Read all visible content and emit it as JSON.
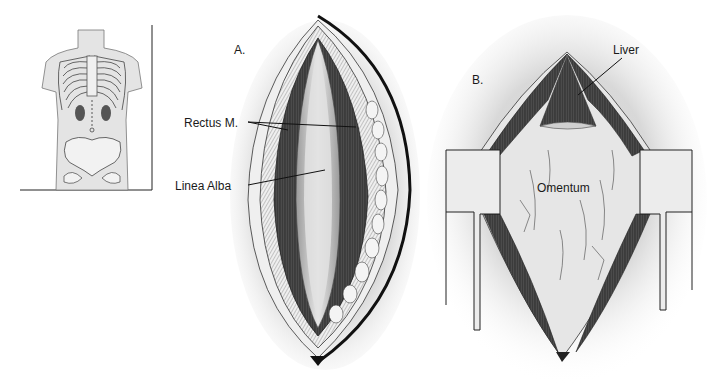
{
  "figure": {
    "panels": [
      {
        "id": "inset",
        "label": "",
        "description": "Torso outline with ribcage, kidneys, pelvis and midline incision marker"
      },
      {
        "id": "A",
        "label": "A.",
        "callouts": [
          {
            "text": "Rectus M.",
            "target": "rectus-muscles"
          },
          {
            "text": "Linea Alba",
            "target": "linea-alba"
          }
        ]
      },
      {
        "id": "B",
        "label": "B.",
        "callouts": [
          {
            "text": "Liver",
            "target": "liver"
          },
          {
            "text": "Omentum",
            "target": "omentum"
          }
        ]
      }
    ]
  },
  "colors": {
    "ink": "#1a1a1a",
    "muscle": "#3a3a3a",
    "fascia": "#d9d9d9",
    "skin": "#e6e6e6",
    "retractor": "#ebebeb",
    "shadow": "#c8c8c8"
  }
}
